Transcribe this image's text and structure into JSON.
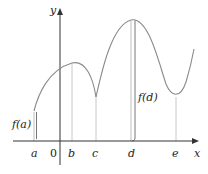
{
  "figure": {
    "axes": {
      "x_label": "x",
      "y_label": "y",
      "origin_label": "0"
    },
    "ticks": [
      {
        "label": "a"
      },
      {
        "label": "b"
      },
      {
        "label": "c"
      },
      {
        "label": "d"
      },
      {
        "label": "e"
      }
    ],
    "annotations": {
      "f_a": "f(a)",
      "f_d": "f(d)"
    },
    "colors": {
      "curve": "#8a8a8a",
      "axis": "#333333",
      "guide": "#c8c8c8",
      "text": "#222222"
    }
  }
}
